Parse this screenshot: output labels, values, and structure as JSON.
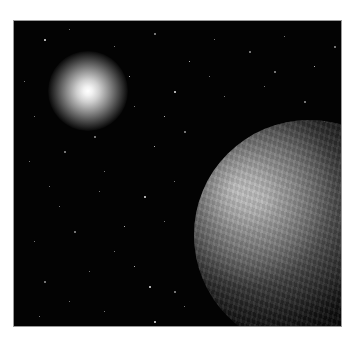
{
  "scene": {
    "description": "Space scene with a bright star and a partially lit planet against a starfield",
    "background_color": "#030303",
    "sun": {
      "cx": 74,
      "cy": 70,
      "radius": 40,
      "color": "#ffffff"
    },
    "planet": {
      "left": 180,
      "top": 99,
      "diameter": 230,
      "lit_side": "upper-left"
    },
    "stars": [
      [
        30,
        18
      ],
      [
        55,
        8
      ],
      [
        100,
        25
      ],
      [
        140,
        12
      ],
      [
        175,
        40
      ],
      [
        200,
        18
      ],
      [
        235,
        30
      ],
      [
        270,
        15
      ],
      [
        300,
        45
      ],
      [
        320,
        25
      ],
      [
        20,
        95
      ],
      [
        120,
        85
      ],
      [
        160,
        70
      ],
      [
        210,
        75
      ],
      [
        250,
        65
      ],
      [
        290,
        80
      ],
      [
        310,
        100
      ],
      [
        15,
        140
      ],
      [
        50,
        130
      ],
      [
        90,
        150
      ],
      [
        140,
        125
      ],
      [
        170,
        110
      ],
      [
        45,
        185
      ],
      [
        85,
        170
      ],
      [
        130,
        175
      ],
      [
        160,
        160
      ],
      [
        20,
        220
      ],
      [
        60,
        210
      ],
      [
        110,
        205
      ],
      [
        150,
        200
      ],
      [
        30,
        260
      ],
      [
        75,
        250
      ],
      [
        120,
        245
      ],
      [
        160,
        270
      ],
      [
        25,
        295
      ],
      [
        90,
        290
      ],
      [
        140,
        300
      ],
      [
        170,
        285
      ],
      [
        230,
        295
      ],
      [
        60,
        60
      ],
      [
        115,
        55
      ],
      [
        195,
        55
      ],
      [
        260,
        50
      ],
      [
        10,
        60
      ],
      [
        150,
        95
      ],
      [
        80,
        115
      ],
      [
        35,
        165
      ],
      [
        100,
        230
      ],
      [
        135,
        265
      ],
      [
        55,
        280
      ]
    ]
  }
}
